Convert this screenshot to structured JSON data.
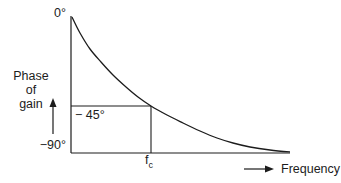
{
  "style": {
    "ink": "#1c1c1c",
    "background": "#ffffff"
  },
  "figure": {
    "y_axis_top_label": "0°",
    "y_axis_title": "Phase\nof\ngain",
    "y_tick_minus45": "− 45°",
    "y_tick_minus90": "−90°",
    "x_tick": {
      "base": "f",
      "sub": "c"
    },
    "x_axis_title": "Frequency"
  },
  "chart_data": {
    "type": "line",
    "title": "",
    "xlabel": "Frequency",
    "ylabel": "Phase of gain",
    "x_ticks": [
      "fc"
    ],
    "y_ticks": [
      "0°",
      "−45°",
      "−90°"
    ],
    "y_range_deg": [
      -90,
      0
    ],
    "grid": false,
    "legend": false,
    "key_points": [
      {
        "frequency": "0",
        "phase_deg": 0
      },
      {
        "frequency": "fc (corner frequency)",
        "phase_deg": -45
      },
      {
        "frequency": "high-frequency limit",
        "phase_deg": -90
      }
    ],
    "annotations": [
      "horizontal guide line at −45° from y-axis to the curve",
      "vertical guide line from the curve down to fc on the frequency axis"
    ],
    "curve_px": [
      [
        72,
        17
      ],
      [
        80,
        33
      ],
      [
        90,
        49
      ],
      [
        101,
        62
      ],
      [
        113,
        75
      ],
      [
        126,
        87
      ],
      [
        138,
        97
      ],
      [
        151,
        106
      ],
      [
        167,
        115
      ],
      [
        183,
        123
      ],
      [
        200,
        131
      ],
      [
        217,
        138
      ],
      [
        233,
        143
      ],
      [
        250,
        147
      ],
      [
        270,
        150
      ],
      [
        290,
        152
      ]
    ],
    "axes_px": {
      "y_axis": [
        71,
        16,
        71,
        153
      ],
      "x_axis": [
        71,
        153,
        290,
        153
      ],
      "guide_45": [
        71,
        106,
        151,
        106
      ],
      "guide_fc": [
        151,
        106,
        151,
        153
      ]
    }
  }
}
